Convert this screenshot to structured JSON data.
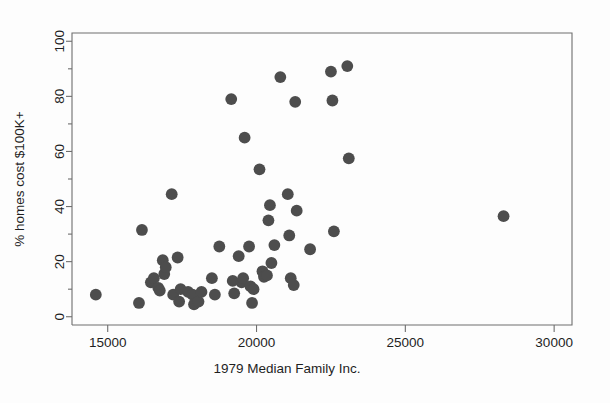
{
  "figure": {
    "background_color": "#fdfdfd",
    "point_color": "#4d4d4d",
    "axis_color": "#6e6e6e"
  },
  "chart_data": {
    "type": "scatter",
    "title": "",
    "subtitle": "",
    "xlabel": "1979 Median Family Inc.",
    "ylabel": "% homes cost $100K+",
    "xlim": [
      13800,
      30600
    ],
    "ylim": [
      -3,
      103
    ],
    "xticks": [
      15000,
      20000,
      25000,
      30000
    ],
    "xtick_labels": [
      "15000",
      "20000",
      "25000",
      "30000"
    ],
    "yticks": [
      0,
      20,
      40,
      60,
      80,
      100
    ],
    "ytick_labels": [
      "0",
      "20",
      "40",
      "60",
      "80",
      "100"
    ],
    "minor_xticks": [],
    "minor_yticks": [
      10,
      30,
      50,
      70,
      90
    ],
    "grid": false,
    "legend": null,
    "marker": "filled-circle",
    "marker_size": 7.2,
    "n_points": 58,
    "points": [
      {
        "x": 14600,
        "y": 8
      },
      {
        "x": 16050,
        "y": 5
      },
      {
        "x": 16150,
        "y": 31.5
      },
      {
        "x": 16450,
        "y": 12.5
      },
      {
        "x": 16550,
        "y": 14
      },
      {
        "x": 16700,
        "y": 10.5
      },
      {
        "x": 16750,
        "y": 9.5
      },
      {
        "x": 16850,
        "y": 20.5
      },
      {
        "x": 16900,
        "y": 15.5
      },
      {
        "x": 16950,
        "y": 18
      },
      {
        "x": 17150,
        "y": 44.5
      },
      {
        "x": 17200,
        "y": 8
      },
      {
        "x": 17350,
        "y": 21.5
      },
      {
        "x": 17400,
        "y": 5.5
      },
      {
        "x": 17450,
        "y": 10
      },
      {
        "x": 17700,
        "y": 9
      },
      {
        "x": 17850,
        "y": 8
      },
      {
        "x": 17900,
        "y": 4.5
      },
      {
        "x": 18050,
        "y": 5.5
      },
      {
        "x": 18150,
        "y": 9
      },
      {
        "x": 18500,
        "y": 14
      },
      {
        "x": 18600,
        "y": 8
      },
      {
        "x": 18750,
        "y": 25.5
      },
      {
        "x": 19150,
        "y": 79
      },
      {
        "x": 19200,
        "y": 13
      },
      {
        "x": 19250,
        "y": 8.5
      },
      {
        "x": 19400,
        "y": 22
      },
      {
        "x": 19500,
        "y": 12.5
      },
      {
        "x": 19550,
        "y": 14
      },
      {
        "x": 19600,
        "y": 65
      },
      {
        "x": 19750,
        "y": 25.5
      },
      {
        "x": 19800,
        "y": 11
      },
      {
        "x": 19850,
        "y": 5
      },
      {
        "x": 19900,
        "y": 10
      },
      {
        "x": 20100,
        "y": 53.5
      },
      {
        "x": 20200,
        "y": 16.5
      },
      {
        "x": 20250,
        "y": 14.5
      },
      {
        "x": 20350,
        "y": 15
      },
      {
        "x": 20400,
        "y": 35
      },
      {
        "x": 20450,
        "y": 40.5
      },
      {
        "x": 20500,
        "y": 19.5
      },
      {
        "x": 20600,
        "y": 26
      },
      {
        "x": 20800,
        "y": 87
      },
      {
        "x": 21050,
        "y": 44.5
      },
      {
        "x": 21100,
        "y": 29.5
      },
      {
        "x": 21150,
        "y": 14
      },
      {
        "x": 21250,
        "y": 11.5
      },
      {
        "x": 21300,
        "y": 78
      },
      {
        "x": 21350,
        "y": 38.5
      },
      {
        "x": 21800,
        "y": 24.5
      },
      {
        "x": 22500,
        "y": 89
      },
      {
        "x": 22550,
        "y": 78.5
      },
      {
        "x": 22600,
        "y": 31
      },
      {
        "x": 23050,
        "y": 91
      },
      {
        "x": 23100,
        "y": 57.5
      },
      {
        "x": 28300,
        "y": 36.5
      }
    ]
  }
}
